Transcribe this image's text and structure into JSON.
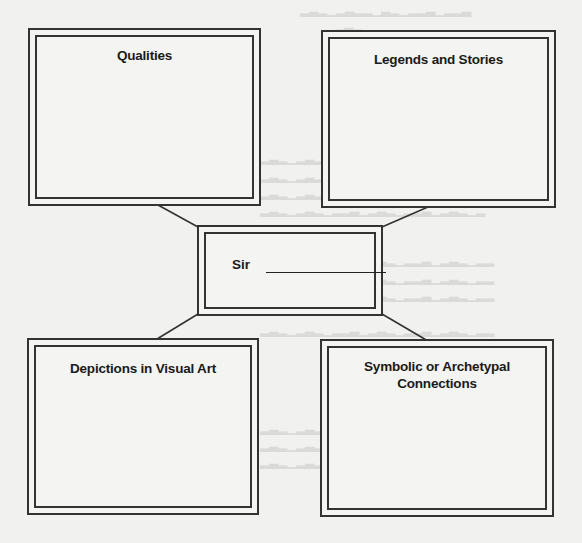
{
  "diagram": {
    "type": "concept-web",
    "center": {
      "label": "Sir",
      "blank": ""
    },
    "boxes": [
      {
        "id": "qualities",
        "title": "Qualities",
        "content": ""
      },
      {
        "id": "legends",
        "title": "Legends and Stories",
        "content": ""
      },
      {
        "id": "depictions",
        "title": "Depictions in Visual Art",
        "content": ""
      },
      {
        "id": "symbolic",
        "title": "Symbolic or Archetypal Connections",
        "content": ""
      }
    ],
    "colors": {
      "line": "#333333",
      "paper": "#f1f1ef",
      "text": "#1a1a1a"
    }
  }
}
